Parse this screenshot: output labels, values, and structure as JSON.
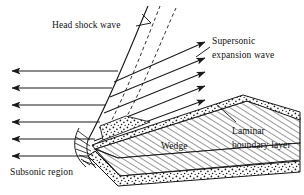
{
  "figure": {
    "background_color": "#ffffff",
    "line_color": "#1a1a1a",
    "width": 304,
    "height": 195
  },
  "labels": {
    "head_shock_wave": "Head shock wave",
    "supersonic_expansion_wave_line1": "Supersonic",
    "supersonic_expansion_wave_line2": "expansion wave",
    "laminar_boundary_layer_line1": "Laminar",
    "laminar_boundary_layer_line2": "boundary layer",
    "wedge": "Wedge",
    "subsonic_region": "Subsonic region"
  },
  "features": {
    "freestream_arrow_count": 6,
    "expansion_arrow_count": 6,
    "shock_dashed_line_count": 2,
    "wedge_fill": "diagonal-hatch",
    "boundary_layer_fill": "stipple-dots"
  }
}
